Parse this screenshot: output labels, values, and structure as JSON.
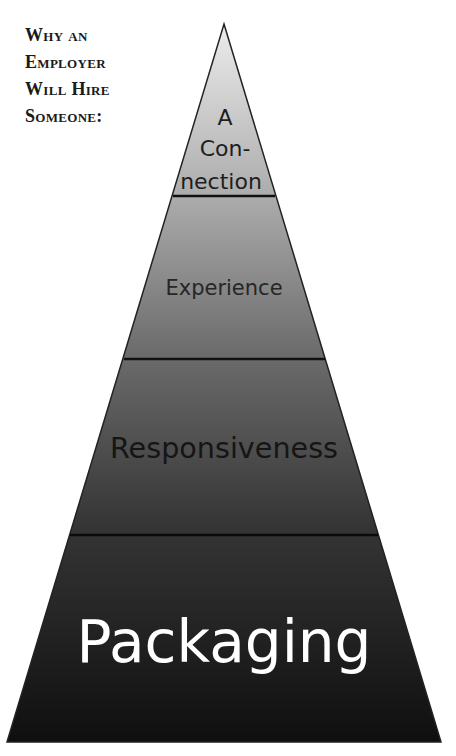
{
  "heading": {
    "lines": [
      "Why an",
      "Employer",
      "Will Hire",
      "Someone:"
    ]
  },
  "pyramid": {
    "apex": [
      224,
      24
    ],
    "base_left": [
      7,
      742
    ],
    "base_right": [
      441,
      742
    ],
    "gradient_top_color": "#ececec",
    "gradient_bottom_color": "#0f0f0f",
    "outline_color": "#222222",
    "tiers": [
      {
        "label_lines": [
          "A",
          "Con-",
          "nection"
        ],
        "text_color": "#1e1e1e",
        "divider_y": 196
      },
      {
        "label": "Experience",
        "text_color": "#262626",
        "divider_y": 359
      },
      {
        "label": "Responsiveness",
        "text_color": "#151515",
        "divider_y": 535
      },
      {
        "label": "Packaging",
        "text_color": "#ffffff"
      }
    ]
  }
}
